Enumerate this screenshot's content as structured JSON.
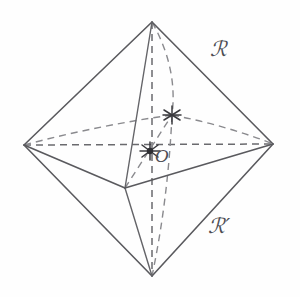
{
  "figure": {
    "name": "octahedron-diagram",
    "background_color": "#fefefe",
    "line_color": "#5a5a5e",
    "dashed_line_color": "#6a6a6e",
    "label_color": "#4e4e54"
  },
  "labels": {
    "region_upper": "ℛ",
    "region_lower": "ℛ′",
    "center": "O"
  },
  "vertices": {
    "top": {
      "name": "top-vertex",
      "x": 152,
      "y": 22
    },
    "bottom": {
      "name": "bottom-vertex",
      "x": 152,
      "y": 276
    },
    "left": {
      "name": "left-vertex",
      "x": 24,
      "y": 145
    },
    "right": {
      "name": "right-vertex",
      "x": 273,
      "y": 144
    },
    "front": {
      "name": "front-vertex",
      "x": 125,
      "y": 188
    },
    "back": {
      "name": "back-vertex",
      "x": 172,
      "y": 115
    },
    "center": {
      "name": "center-point",
      "x": 150,
      "y": 151
    }
  },
  "edges_solid": [
    {
      "name": "edge-top-left",
      "from": "top",
      "to": "left"
    },
    {
      "name": "edge-top-right",
      "from": "top",
      "to": "right"
    },
    {
      "name": "edge-top-front",
      "from": "top",
      "to": "front"
    },
    {
      "name": "edge-bottom-left",
      "from": "bottom",
      "to": "left"
    },
    {
      "name": "edge-bottom-right",
      "from": "bottom",
      "to": "right"
    },
    {
      "name": "edge-bottom-front",
      "from": "bottom",
      "to": "front"
    },
    {
      "name": "edge-front-left",
      "from": "front",
      "to": "left"
    },
    {
      "name": "edge-front-right",
      "from": "front",
      "to": "right"
    }
  ],
  "edges_dashed": [
    {
      "name": "edge-top-back",
      "from": "top",
      "to": "back"
    },
    {
      "name": "edge-bottom-back",
      "from": "bottom",
      "to": "back"
    },
    {
      "name": "edge-back-left",
      "from": "back",
      "to": "left"
    },
    {
      "name": "edge-back-right",
      "from": "back",
      "to": "right"
    }
  ],
  "diagonals_dashed": [
    {
      "name": "diagonal-vertical",
      "from": "top",
      "to": "bottom"
    },
    {
      "name": "diagonal-horizontal",
      "from": "left",
      "to": "right"
    },
    {
      "name": "diagonal-depth",
      "from": "front",
      "to": "back"
    }
  ]
}
